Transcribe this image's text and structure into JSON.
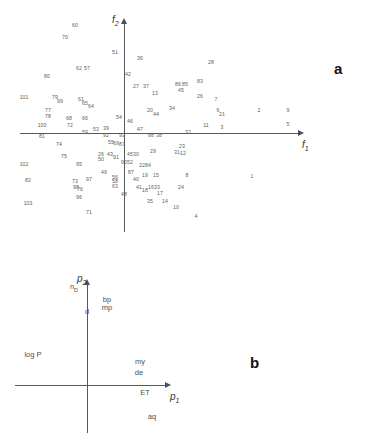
{
  "figure": {
    "panels": [
      {
        "letter": "a",
        "letter_x": 334,
        "letter_y": 67
      },
      {
        "letter": "b",
        "letter_x": 250,
        "letter_y": 365
      }
    ]
  },
  "chart_data": [
    {
      "type": "scatter",
      "panel": "a",
      "title": "",
      "xlabel": "f1",
      "ylabel": "f2",
      "xlabel_display": "f",
      "xlabel_sub": "1",
      "ylabel_display": "f",
      "ylabel_sub": "2",
      "grid": false,
      "axes_style": "crossed-arrows-at-origin",
      "origin_px": {
        "x": 124,
        "y": 133
      },
      "x_axis_span_px": {
        "from": 20,
        "to": 298
      },
      "y_axis_span_px": {
        "from": 18,
        "to": 232
      },
      "point_label_type": "sample-number",
      "points": [
        {
          "label": "60",
          "x": 75,
          "y": 26
        },
        {
          "label": "70",
          "x": 65,
          "y": 38
        },
        {
          "label": "51",
          "x": 115,
          "y": 53
        },
        {
          "label": "36",
          "x": 140,
          "y": 59
        },
        {
          "label": "28",
          "x": 211,
          "y": 63
        },
        {
          "label": "62",
          "x": 79,
          "y": 69
        },
        {
          "label": "57",
          "x": 87,
          "y": 69
        },
        {
          "label": "80",
          "x": 47,
          "y": 77
        },
        {
          "label": "42",
          "x": 128,
          "y": 75
        },
        {
          "label": "27",
          "x": 136,
          "y": 87
        },
        {
          "label": "37",
          "x": 146,
          "y": 87
        },
        {
          "label": "86",
          "x": 178,
          "y": 85
        },
        {
          "label": "85",
          "x": 185,
          "y": 85
        },
        {
          "label": "83",
          "x": 200,
          "y": 82
        },
        {
          "label": "45",
          "x": 181,
          "y": 91
        },
        {
          "label": "13",
          "x": 155,
          "y": 94
        },
        {
          "label": "101",
          "x": 24,
          "y": 98
        },
        {
          "label": "79",
          "x": 55,
          "y": 98
        },
        {
          "label": "99",
          "x": 60,
          "y": 102
        },
        {
          "label": "61",
          "x": 81,
          "y": 100
        },
        {
          "label": "65",
          "x": 85,
          "y": 104
        },
        {
          "label": "64",
          "x": 91,
          "y": 107
        },
        {
          "label": "26",
          "x": 200,
          "y": 97
        },
        {
          "label": "7",
          "x": 216,
          "y": 100
        },
        {
          "label": "20",
          "x": 150,
          "y": 111
        },
        {
          "label": "44",
          "x": 156,
          "y": 115
        },
        {
          "label": "34",
          "x": 172,
          "y": 109
        },
        {
          "label": "6",
          "x": 218,
          "y": 111
        },
        {
          "label": "21",
          "x": 222,
          "y": 115
        },
        {
          "label": "2",
          "x": 259,
          "y": 111
        },
        {
          "label": "9",
          "x": 288,
          "y": 111
        },
        {
          "label": "77",
          "x": 48,
          "y": 111
        },
        {
          "label": "78",
          "x": 48,
          "y": 117
        },
        {
          "label": "68",
          "x": 69,
          "y": 119
        },
        {
          "label": "66",
          "x": 85,
          "y": 119
        },
        {
          "label": "54",
          "x": 119,
          "y": 118
        },
        {
          "label": "46",
          "x": 130,
          "y": 122
        },
        {
          "label": "11",
          "x": 206,
          "y": 126
        },
        {
          "label": "3",
          "x": 222,
          "y": 128
        },
        {
          "label": "5",
          "x": 288,
          "y": 125
        },
        {
          "label": "100",
          "x": 42,
          "y": 126
        },
        {
          "label": "72",
          "x": 70,
          "y": 126
        },
        {
          "label": "47",
          "x": 140,
          "y": 130
        },
        {
          "label": "59",
          "x": 85,
          "y": 133
        },
        {
          "label": "53",
          "x": 96,
          "y": 130
        },
        {
          "label": "39",
          "x": 106,
          "y": 129
        },
        {
          "label": "92",
          "x": 106,
          "y": 136
        },
        {
          "label": "93",
          "x": 122,
          "y": 136
        },
        {
          "label": "88",
          "x": 151,
          "y": 136
        },
        {
          "label": "38",
          "x": 159,
          "y": 136
        },
        {
          "label": "32",
          "x": 188,
          "y": 133
        },
        {
          "label": "81",
          "x": 42,
          "y": 137
        },
        {
          "label": "55",
          "x": 111,
          "y": 143
        },
        {
          "label": "69",
          "x": 116,
          "y": 144
        },
        {
          "label": "87",
          "x": 122,
          "y": 145
        },
        {
          "label": "74",
          "x": 59,
          "y": 145
        },
        {
          "label": "23",
          "x": 182,
          "y": 147
        },
        {
          "label": "29",
          "x": 153,
          "y": 152
        },
        {
          "label": "31",
          "x": 177,
          "y": 153
        },
        {
          "label": "12",
          "x": 183,
          "y": 154
        },
        {
          "label": "75",
          "x": 64,
          "y": 157
        },
        {
          "label": "26b",
          "x": 101,
          "y": 155
        },
        {
          "label": "50",
          "x": 101,
          "y": 160
        },
        {
          "label": "43",
          "x": 110,
          "y": 155
        },
        {
          "label": "91",
          "x": 116,
          "y": 158
        },
        {
          "label": "45b",
          "x": 130,
          "y": 155
        },
        {
          "label": "30",
          "x": 136,
          "y": 155
        },
        {
          "label": "90",
          "x": 124,
          "y": 163
        },
        {
          "label": "52",
          "x": 130,
          "y": 163
        },
        {
          "label": "95",
          "x": 79,
          "y": 165
        },
        {
          "label": "102",
          "x": 24,
          "y": 165
        },
        {
          "label": "22",
          "x": 142,
          "y": 166
        },
        {
          "label": "84",
          "x": 148,
          "y": 166
        },
        {
          "label": "49",
          "x": 104,
          "y": 173
        },
        {
          "label": "87b",
          "x": 131,
          "y": 173
        },
        {
          "label": "19",
          "x": 145,
          "y": 176
        },
        {
          "label": "15",
          "x": 156,
          "y": 176
        },
        {
          "label": "8",
          "x": 187,
          "y": 176
        },
        {
          "label": "56",
          "x": 115,
          "y": 178
        },
        {
          "label": "58",
          "x": 115,
          "y": 182
        },
        {
          "label": "63",
          "x": 115,
          "y": 187
        },
        {
          "label": "97",
          "x": 89,
          "y": 180
        },
        {
          "label": "82",
          "x": 28,
          "y": 181
        },
        {
          "label": "73",
          "x": 75,
          "y": 182
        },
        {
          "label": "98",
          "x": 76,
          "y": 188
        },
        {
          "label": "76",
          "x": 80,
          "y": 190
        },
        {
          "label": "40",
          "x": 136,
          "y": 180
        },
        {
          "label": "41",
          "x": 139,
          "y": 188
        },
        {
          "label": "18",
          "x": 145,
          "y": 191
        },
        {
          "label": "16",
          "x": 151,
          "y": 188
        },
        {
          "label": "33",
          "x": 157,
          "y": 188
        },
        {
          "label": "24",
          "x": 181,
          "y": 188
        },
        {
          "label": "17",
          "x": 160,
          "y": 194
        },
        {
          "label": "96",
          "x": 79,
          "y": 198
        },
        {
          "label": "48",
          "x": 124,
          "y": 195
        },
        {
          "label": "35",
          "x": 150,
          "y": 202
        },
        {
          "label": "14",
          "x": 165,
          "y": 202
        },
        {
          "label": "10",
          "x": 176,
          "y": 208
        },
        {
          "label": "103",
          "x": 28,
          "y": 204
        },
        {
          "label": "71",
          "x": 89,
          "y": 213
        },
        {
          "label": "4",
          "x": 196,
          "y": 217
        },
        {
          "label": "1",
          "x": 252,
          "y": 177
        }
      ]
    },
    {
      "type": "scatter",
      "panel": "b",
      "title": "",
      "xlabel": "p1",
      "ylabel": "p2",
      "xlabel_display": "p",
      "xlabel_sub": "1",
      "ylabel_display": "p",
      "ylabel_sub": "2",
      "grid": false,
      "axes_style": "crossed-arrows-at-origin",
      "origin_px": {
        "x": 87,
        "y": 385
      },
      "x_axis_span_px": {
        "from": 15,
        "to": 165
      },
      "y_axis_span_px": {
        "from": 279,
        "to": 433
      },
      "point_label_type": "variable-name",
      "points": [
        {
          "label": "nD",
          "label_html": "n<sub>D</sub>",
          "x": 74,
          "y": 288
        },
        {
          "label": "d",
          "label_html": "d",
          "x": 87,
          "y": 312
        },
        {
          "label": "bp",
          "label_html": "bp",
          "x": 107,
          "y": 300
        },
        {
          "label": "mp",
          "label_html": "mp",
          "x": 107,
          "y": 308
        },
        {
          "label": "log P",
          "label_html": "log P",
          "x": 33,
          "y": 355
        },
        {
          "label": "my",
          "label_html": "my",
          "x": 140,
          "y": 362
        },
        {
          "label": "de",
          "label_html": "de",
          "x": 139,
          "y": 373
        },
        {
          "label": "ET",
          "label_html": "ET",
          "x": 145,
          "y": 393
        },
        {
          "label": "aq",
          "label_html": "aq",
          "x": 152,
          "y": 417
        }
      ]
    }
  ],
  "colors": {
    "axis": "#555a5e",
    "arrow": "#4b5055",
    "point_text": "#5c6164",
    "axis_label": "#2f3335",
    "panel_letter": "#111111",
    "background": "#ffffff"
  }
}
